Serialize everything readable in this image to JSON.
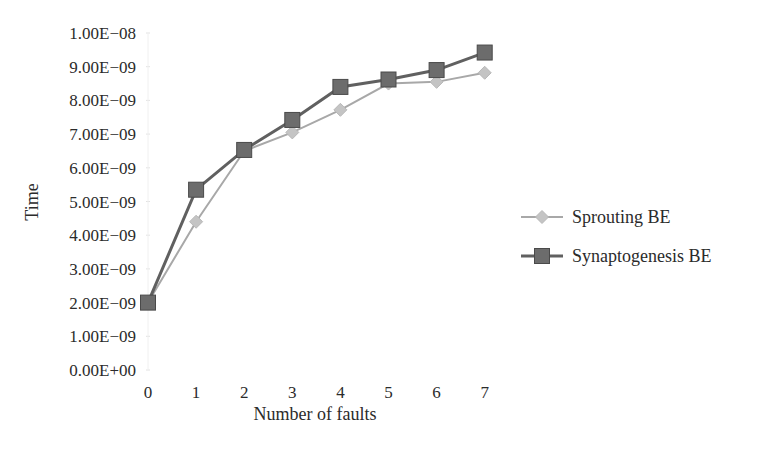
{
  "chart_data": {
    "type": "line",
    "title": "",
    "xlabel": "Number of faults",
    "ylabel": "Time",
    "x": [
      0,
      1,
      2,
      3,
      4,
      5,
      6,
      7
    ],
    "x_tick_labels": [
      "0",
      "1",
      "2",
      "3",
      "4",
      "5",
      "6",
      "7"
    ],
    "ylim": [
      0,
      1e-08
    ],
    "y_tick_values": [
      0,
      1e-09,
      2e-09,
      3e-09,
      4e-09,
      5e-09,
      6e-09,
      7e-09,
      8e-09,
      9e-09,
      1e-08
    ],
    "y_tick_labels": [
      "0.00E+00",
      "1.00E−09",
      "2.00E−09",
      "3.00E−09",
      "4.00E−09",
      "5.00E−09",
      "6.00E−09",
      "7.00E−09",
      "8.00E−09",
      "9.00E−09",
      "1.00E−08"
    ],
    "grid": false,
    "legend_position": "right",
    "series": [
      {
        "name": "Sprouting BE",
        "marker": "diamond",
        "color": "#a8a8a8",
        "values": [
          2e-09,
          4.4e-09,
          6.5e-09,
          7.05e-09,
          7.72e-09,
          8.5e-09,
          8.55e-09,
          8.82e-09
        ]
      },
      {
        "name": "Synaptogenesis BE",
        "marker": "square",
        "color": "#606060",
        "values": [
          2e-09,
          5.35e-09,
          6.53e-09,
          7.42e-09,
          8.4e-09,
          8.62e-09,
          8.9e-09,
          9.42e-09
        ]
      }
    ]
  },
  "legend": {
    "items": [
      {
        "label": "Sprouting BE"
      },
      {
        "label": "Synaptogenesis BE"
      }
    ]
  },
  "title_cropped": "…ng p…"
}
